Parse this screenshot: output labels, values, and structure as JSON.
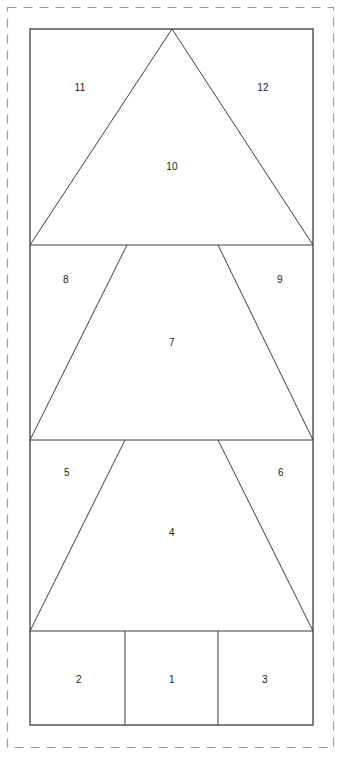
{
  "canvas": {
    "width": 342,
    "height": 762,
    "background_color": "#ffffff"
  },
  "colors": {
    "line_color": "#3f3f3f",
    "outline_color": "#4a4a4a",
    "dashed_border_color": "#9a9a9a",
    "label_color": "#1a1a1a",
    "fill_color": "#ffffff"
  },
  "trim_border": {
    "x": 7,
    "y": 7,
    "width": 327,
    "height": 741,
    "style": "dashed"
  },
  "block_outline": {
    "x": 30,
    "y": 29,
    "width": 283,
    "height": 696,
    "style": "solid"
  },
  "rows": [
    {
      "name": "top-tier",
      "y_top": 29,
      "y_bottom": 245
    },
    {
      "name": "middle-tier",
      "y_top": 245,
      "y_bottom": 440
    },
    {
      "name": "lower-tier",
      "y_top": 440,
      "y_bottom": 631
    },
    {
      "name": "trunk-row",
      "y_top": 631,
      "y_bottom": 725
    }
  ],
  "divider_lines": [
    {
      "name": "divider-tier1-tier2",
      "x1": 30,
      "y1": 245,
      "x2": 313,
      "y2": 245
    },
    {
      "name": "divider-tier2-tier3",
      "x1": 30,
      "y1": 440,
      "x2": 313,
      "y2": 440
    },
    {
      "name": "divider-tier3-trunk",
      "x1": 30,
      "y1": 631,
      "x2": 313,
      "y2": 631
    },
    {
      "name": "trunk-divider-left",
      "x1": 125,
      "y1": 631,
      "x2": 125,
      "y2": 725
    },
    {
      "name": "trunk-divider-right",
      "x1": 218,
      "y1": 631,
      "x2": 218,
      "y2": 725
    }
  ],
  "diagonal_lines": [
    {
      "name": "tier1-left-slope",
      "x1": 172,
      "y1": 29,
      "x2": 30,
      "y2": 245
    },
    {
      "name": "tier1-right-slope",
      "x1": 172,
      "y1": 29,
      "x2": 313,
      "y2": 245
    },
    {
      "name": "tier2-left-slope",
      "x1": 127,
      "y1": 245,
      "x2": 30,
      "y2": 440
    },
    {
      "name": "tier2-right-slope",
      "x1": 218,
      "y1": 245,
      "x2": 313,
      "y2": 440
    },
    {
      "name": "tier3-left-slope",
      "x1": 125,
      "y1": 440,
      "x2": 30,
      "y2": 631
    },
    {
      "name": "tier3-right-slope",
      "x1": 218,
      "y1": 440,
      "x2": 313,
      "y2": 631
    }
  ],
  "pieces": [
    {
      "id": "piece-1",
      "label": "1",
      "x": 172,
      "y": 680,
      "region": "trunk-center"
    },
    {
      "id": "piece-2",
      "label": "2",
      "x": 79,
      "y": 680,
      "region": "trunk-left"
    },
    {
      "id": "piece-3",
      "label": "3",
      "x": 265,
      "y": 680,
      "region": "trunk-right"
    },
    {
      "id": "piece-4",
      "label": "4",
      "x": 172,
      "y": 533,
      "region": "lower-tier-center"
    },
    {
      "id": "piece-5",
      "label": "5",
      "x": 67,
      "y": 473,
      "region": "lower-tier-left"
    },
    {
      "id": "piece-6",
      "label": "6",
      "x": 281,
      "y": 473,
      "region": "lower-tier-right"
    },
    {
      "id": "piece-7",
      "label": "7",
      "x": 172,
      "y": 343,
      "region": "middle-tier-center"
    },
    {
      "id": "piece-8",
      "label": "8",
      "x": 66,
      "y": 280,
      "region": "middle-tier-left"
    },
    {
      "id": "piece-9",
      "label": "9",
      "x": 280,
      "y": 280,
      "region": "middle-tier-right"
    },
    {
      "id": "piece-10",
      "label": "10",
      "x": 172,
      "y": 167,
      "region": "top-tier-center"
    },
    {
      "id": "piece-11",
      "label": "11",
      "x": 80,
      "y": 88,
      "region": "top-tier-left"
    },
    {
      "id": "piece-12",
      "label": "12",
      "x": 263,
      "y": 88,
      "region": "top-tier-right"
    }
  ]
}
